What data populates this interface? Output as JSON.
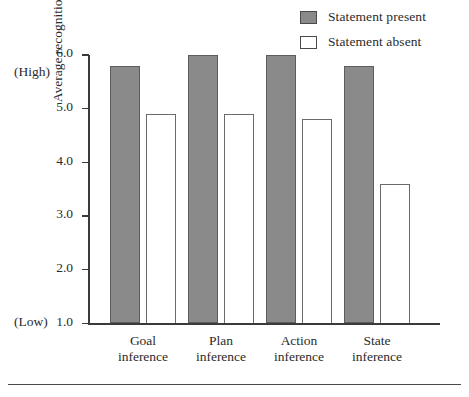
{
  "chart_data": {
    "type": "bar",
    "title": "",
    "xlabel": "",
    "ylabel": "Average recognition rating",
    "categories": [
      "Goal\ninference",
      "Plan\ninference",
      "Action\ninference",
      "State\ninference"
    ],
    "category_lines": [
      [
        "Goal",
        "inference"
      ],
      [
        "Plan",
        "inference"
      ],
      [
        "Action",
        "inference"
      ],
      [
        "State",
        "inference"
      ]
    ],
    "series": [
      {
        "name": "Statement present",
        "values": [
          5.8,
          6.0,
          6.0,
          5.8
        ],
        "color": "#8a8a8a",
        "style": "filled"
      },
      {
        "name": "Statement absent",
        "values": [
          4.9,
          4.9,
          4.8,
          3.6
        ],
        "color": "#ffffff",
        "style": "outlined"
      }
    ],
    "ylim": [
      1.0,
      6.0
    ],
    "yticks": [
      1.0,
      2.0,
      3.0,
      4.0,
      5.0,
      6.0
    ],
    "ytick_labels": [
      "1.0",
      "2.0",
      "3.0",
      "4.0",
      "5.0",
      "6.0"
    ],
    "grid": false,
    "legend_position": "top-right",
    "scale_high_label": "(High)",
    "scale_low_label": "(Low)"
  },
  "legend": {
    "items": [
      {
        "label": "Statement present",
        "swatch": "filled-gray-square"
      },
      {
        "label": "Statement absent",
        "swatch": "empty-white-square"
      }
    ]
  },
  "axis": {
    "y_title": "Average recognition rating",
    "high_label": "(High)",
    "low_label": "(Low)"
  }
}
